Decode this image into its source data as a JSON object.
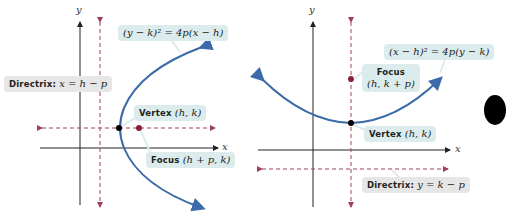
{
  "colors": {
    "curve": "#3a6aa8",
    "axis": "#222222",
    "dashed": "#a04058",
    "point_focus": "#8a1f35",
    "point_vertex": "#000000",
    "label_bg": "#dcecec",
    "directrix_label_bg": "#e6e6e6"
  },
  "left_graph": {
    "axis_x_label": "x",
    "axis_y_label": "y",
    "equation": "(y − k)² = 4p(x − h)",
    "directrix_label_bold": "Directrix:",
    "directrix_label_math": "x = h − p",
    "vertex_label_bold": "Vertex",
    "vertex_label_math": "(h, k)",
    "focus_label_bold": "Focus",
    "focus_label_math": "(h + p, k)",
    "orientation": "opens right"
  },
  "right_graph": {
    "axis_x_label": "x",
    "axis_y_label": "y",
    "equation": "(x − h)² = 4p(y − k)",
    "focus_label_bold": "Focus",
    "focus_label_math": "(h, k + p)",
    "vertex_label_bold": "Vertex",
    "vertex_label_math": "(h, k)",
    "directrix_label_bold": "Directrix:",
    "directrix_label_math": "y = k − p",
    "orientation": "opens up"
  }
}
